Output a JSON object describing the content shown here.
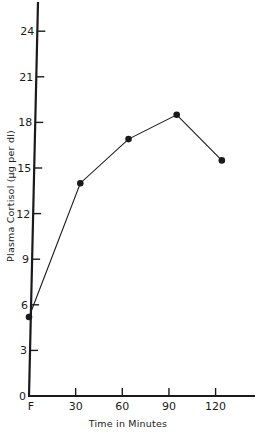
{
  "chart_data": {
    "type": "line",
    "title": "",
    "xlabel": "Time in Minutes",
    "ylabel": "Plasma Cortisol (µg per dl)",
    "x_tick_labels": [
      "F",
      "30",
      "60",
      "90",
      "120"
    ],
    "x_ticks": [
      0,
      30,
      60,
      90,
      120
    ],
    "y_ticks": [
      0,
      3,
      6,
      9,
      12,
      15,
      18,
      21,
      24
    ],
    "y_tick_labels": [
      "0",
      "3",
      "6",
      "9",
      "12",
      "15",
      "18",
      "21",
      "24"
    ],
    "xlim": [
      0,
      150
    ],
    "ylim": [
      0,
      26
    ],
    "grid": false,
    "legend": null,
    "series": [
      {
        "name": "Plasma Cortisol",
        "x": [
          0,
          33,
          64,
          95,
          124
        ],
        "values": [
          5.2,
          14.0,
          16.9,
          18.5,
          15.5
        ],
        "marker": "filled-circle",
        "color": "#1a1a1a"
      }
    ]
  },
  "colors": {
    "background": "#ffffff",
    "ink": "#1a1a1a"
  }
}
